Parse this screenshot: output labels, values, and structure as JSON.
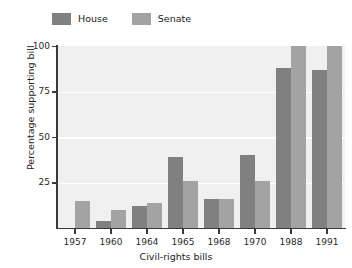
{
  "chart_data": {
    "type": "bar",
    "title": "",
    "xlabel": "Civil-rights bills",
    "ylabel": "Percentage supporting bill",
    "categories": [
      "1957",
      "1960",
      "1964",
      "1965",
      "1968",
      "1970",
      "1988",
      "1991"
    ],
    "series": [
      {
        "name": "House",
        "color": "#808080",
        "values": [
          null,
          4,
          12,
          39,
          16,
          40,
          88,
          87
        ]
      },
      {
        "name": "Senate",
        "color": "#a3a3a3",
        "values": [
          15,
          10,
          14,
          26,
          16,
          26,
          100,
          100
        ]
      }
    ],
    "ylim": [
      0,
      100
    ],
    "yticks": [
      25,
      50,
      75,
      100
    ],
    "ytick_labels": [
      "25",
      "50",
      "75",
      "100"
    ],
    "grid": "horizontal",
    "legend_position": "above-left",
    "plot_background": "#f0f0f0",
    "gridline_color": "#ffffff",
    "axis_color": "#3a3a3a"
  },
  "legend": {
    "entries": [
      {
        "label": "House",
        "swatch_color": "#808080"
      },
      {
        "label": "Senate",
        "swatch_color": "#a3a3a3"
      }
    ]
  },
  "axes": {
    "y_title": "Percentage supporting bill",
    "x_title": "Civil-rights bills"
  }
}
